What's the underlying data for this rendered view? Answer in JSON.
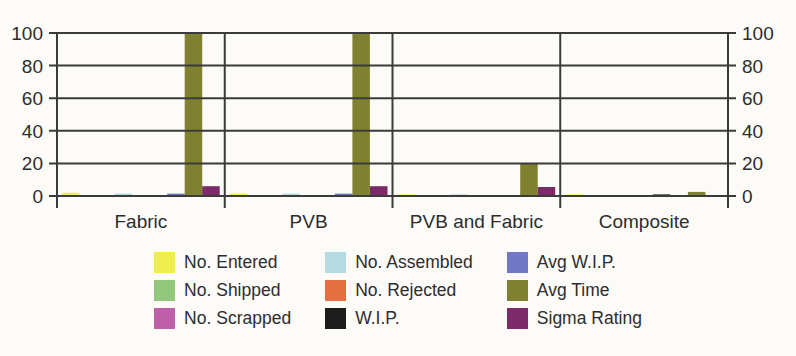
{
  "colors": {
    "background": "#fcfbf8",
    "axis": "#3b3b3b",
    "text": "#2d2d2d"
  },
  "chart_data": {
    "type": "bar",
    "title": "",
    "xlabel": "",
    "ylabel": "",
    "categories": [
      "Fabric",
      "PVB",
      "PVB and Fabric",
      "Composite"
    ],
    "series": [
      {
        "name": "No. Entered",
        "color": "#f0ee4f",
        "values": [
          2,
          1.5,
          1,
          1
        ]
      },
      {
        "name": "No. Shipped",
        "color": "#93c77b",
        "values": [
          0,
          0,
          0,
          0
        ]
      },
      {
        "name": "No. Scrapped",
        "color": "#bd60a8",
        "values": [
          0,
          0,
          0,
          0
        ]
      },
      {
        "name": "No. Assembled",
        "color": "#b4dbe2",
        "values": [
          1.5,
          1.5,
          1,
          0
        ]
      },
      {
        "name": "No. Rejected",
        "color": "#e4703f",
        "values": [
          0,
          0,
          0,
          0
        ]
      },
      {
        "name": "W.I.P.",
        "color": "#1c1c1c",
        "values": [
          0,
          0,
          0,
          1
        ]
      },
      {
        "name": "Avg W.I.P.",
        "color": "#7277c6",
        "values": [
          1.5,
          1.5,
          0.5,
          0
        ]
      },
      {
        "name": "Avg Time",
        "color": "#7f8030",
        "values": [
          100,
          100,
          20,
          2.5
        ]
      },
      {
        "name": "Sigma Rating",
        "color": "#7b2b67",
        "values": [
          6,
          6,
          5.5,
          0
        ]
      }
    ],
    "ylim": [
      0,
      100
    ],
    "yticks": [
      0,
      20,
      40,
      60,
      80,
      100
    ],
    "y_axis_sides": "both",
    "grid": "horizontal",
    "gridlines_over_bars": true,
    "legend_position": "bottom",
    "legend_columns": 3,
    "legend_fill": "column-major"
  }
}
